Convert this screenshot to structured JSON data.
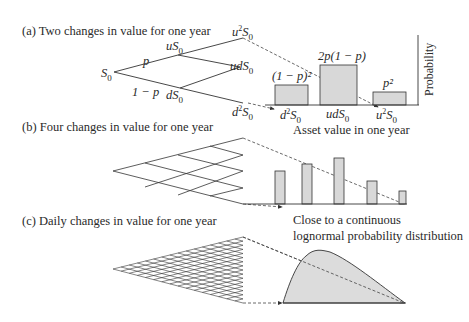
{
  "panels": {
    "a": {
      "title": "(a) Two changes in value for one year",
      "tree": {
        "root": "S0",
        "up_node": "uS0",
        "down_node": "dS0",
        "up_prob": "p",
        "down_prob": "1 − p",
        "terminals": [
          "u²S0",
          "udS0",
          "d²S0"
        ]
      },
      "histogram": {
        "y_axis_label": "Probability",
        "x_axis_label": "Asset value in one year",
        "bar_labels": [
          "(1 − p)²",
          "2p(1 − p)",
          "p²"
        ],
        "categories": [
          "d²S0",
          "udS0",
          "u²S0"
        ]
      }
    },
    "b": {
      "title": "(b) Four changes in value for one year"
    },
    "c": {
      "title": "(c) Daily changes in value for one year",
      "caption_line1": "Close to a continuous",
      "caption_line2": "lognormal probability distribution"
    }
  },
  "text": {
    "S0_sub": "0",
    "S": "S",
    "uS": "uS",
    "dS": "dS",
    "u2S_u": "u",
    "sup2": "2",
    "udS": "udS",
    "d2S_d": "d"
  },
  "chart_data": [
    {
      "type": "bar",
      "title": "(a) Two changes in value for one year",
      "categories": [
        "d²S0",
        "udS0",
        "u²S0"
      ],
      "bar_labels": [
        "(1 − p)²",
        "2p(1 − p)",
        "p²"
      ],
      "values": [
        0.25,
        0.5,
        0.16
      ],
      "xlabel": "Asset value in one year",
      "ylabel": "Probability"
    },
    {
      "type": "bar",
      "title": "(b) Four changes in value for one year",
      "categories": [
        "d⁴S0",
        "ud³S0",
        "u²d²S0",
        "u³dS0",
        "u⁴S0"
      ],
      "values": [
        0.33,
        0.4,
        0.46,
        0.23,
        0.13
      ]
    },
    {
      "type": "area",
      "title": "(c) Daily changes in value for one year",
      "annotation": "Close to a continuous lognormal probability distribution",
      "shape": "right-skewed lognormal"
    }
  ],
  "colors": {
    "bar_fill": "#d8d8d8",
    "line": "#333333",
    "dashed": "#444444"
  }
}
